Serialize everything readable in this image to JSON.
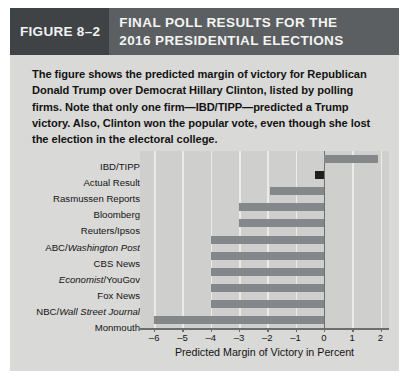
{
  "figure": {
    "tag": "FIGURE 8–2",
    "title_line1": "FINAL POLL RESULTS FOR THE",
    "title_line2": "2016 PRESIDENTIAL ELECTIONS",
    "caption": "The figure shows the predicted margin of victory for Republican Donald Trump over Democrat Hillary Clinton, listed by polling firms. Note that only one firm—IBD/TIPP—predicted a Trump victory. Also, Clinton won the popular vote, even though she lost the election in the electoral college.",
    "colors": {
      "title_bar": "#5b5f62",
      "tag_box": "#3f4346",
      "page_background": "#d9d9d7",
      "plot_background": "#cfd0ce",
      "bar": "#85888a",
      "actual_result_bar": "#1d1f1f",
      "gridline": "#ebebe8",
      "axis": "#6b6e6c"
    }
  },
  "chart_data": {
    "type": "bar",
    "orientation": "horizontal",
    "title": "FINAL POLL RESULTS FOR THE 2016 PRESIDENTIAL ELECTIONS",
    "xlabel": "Predicted Margin of Victory in Percent",
    "ylabel": "",
    "xlim": [
      -6.5,
      2.3
    ],
    "ylim": null,
    "grid": true,
    "legend": false,
    "xticks": [
      -6,
      -5,
      -4,
      -3,
      -2,
      -1,
      0,
      1,
      2
    ],
    "xticklabels": [
      "–6",
      "–5",
      "–4",
      "–3",
      "–2",
      "–1",
      "0",
      "1",
      "2"
    ],
    "categories": [
      "IBD/TIPP",
      "Actual Result",
      "Rasmussen Reports",
      "Bloomberg",
      "Reuters/Ipsos",
      "ABC/Washington Post",
      "CBS News",
      "Economist/YouGov",
      "Fox News",
      "NBC/Wall Street Journal",
      "Monmouth"
    ],
    "values": [
      1.9,
      -0.3,
      -1.9,
      -3.0,
      -3.0,
      -4.0,
      -4.0,
      -4.0,
      -4.0,
      -4.0,
      -6.0
    ],
    "bars": [
      {
        "label": "IBD/TIPP",
        "label_parts": [
          {
            "t": "IBD/TIPP",
            "italic": false
          }
        ],
        "value": 1.9,
        "highlight": false
      },
      {
        "label": "Actual Result",
        "label_parts": [
          {
            "t": "Actual Result",
            "italic": false
          }
        ],
        "value": -0.3,
        "highlight": true
      },
      {
        "label": "Rasmussen Reports",
        "label_parts": [
          {
            "t": "Rasmussen Reports",
            "italic": false
          }
        ],
        "value": -1.9,
        "highlight": false
      },
      {
        "label": "Bloomberg",
        "label_parts": [
          {
            "t": "Bloomberg",
            "italic": false
          }
        ],
        "value": -3.0,
        "highlight": false
      },
      {
        "label": "Reuters/Ipsos",
        "label_parts": [
          {
            "t": "Reuters/Ipsos",
            "italic": false
          }
        ],
        "value": -3.0,
        "highlight": false
      },
      {
        "label": "ABC/Washington Post",
        "label_parts": [
          {
            "t": "ABC/",
            "italic": false
          },
          {
            "t": "Washington Post",
            "italic": true
          }
        ],
        "value": -4.0,
        "highlight": false
      },
      {
        "label": "CBS News",
        "label_parts": [
          {
            "t": "CBS News",
            "italic": false
          }
        ],
        "value": -4.0,
        "highlight": false
      },
      {
        "label": "Economist/YouGov",
        "label_parts": [
          {
            "t": "Economist",
            "italic": true
          },
          {
            "t": "/YouGov",
            "italic": false
          }
        ],
        "value": -4.0,
        "highlight": false
      },
      {
        "label": "Fox News",
        "label_parts": [
          {
            "t": "Fox News",
            "italic": false
          }
        ],
        "value": -4.0,
        "highlight": false
      },
      {
        "label": "NBC/Wall Street Journal",
        "label_parts": [
          {
            "t": "NBC/",
            "italic": false
          },
          {
            "t": "Wall Street Journal",
            "italic": true
          }
        ],
        "value": -4.0,
        "highlight": false
      },
      {
        "label": "Monmouth",
        "label_parts": [
          {
            "t": "Monmouth",
            "italic": false
          }
        ],
        "value": -6.0,
        "highlight": false
      }
    ]
  }
}
